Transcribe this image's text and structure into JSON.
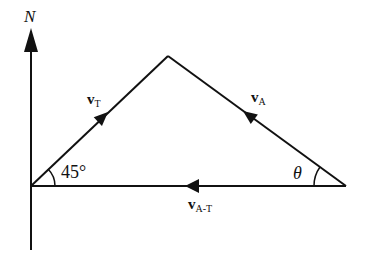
{
  "diagram": {
    "type": "vector-triangle",
    "north_axis": {
      "label": "N"
    },
    "vectors": [
      {
        "id": "v_t",
        "symbol": "v",
        "subscript": "T",
        "from": "origin",
        "to": "apex",
        "direction": "up-right"
      },
      {
        "id": "v_a",
        "symbol": "v",
        "subscript": "A",
        "from": "right-vertex",
        "to": "apex",
        "direction": "up-left"
      },
      {
        "id": "v_at",
        "symbol": "v",
        "subscript": "A-T",
        "from": "right-vertex",
        "to": "origin",
        "direction": "left"
      }
    ],
    "angles": [
      {
        "id": "angle_origin",
        "label": "45°",
        "at": "origin"
      },
      {
        "id": "angle_right",
        "label": "θ",
        "at": "right-vertex"
      }
    ],
    "colors": {
      "stroke": "#111111",
      "background": "#ffffff"
    }
  }
}
